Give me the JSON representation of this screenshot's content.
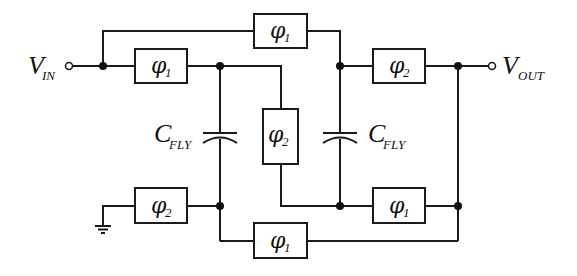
{
  "diagram": {
    "type": "switched-capacitor circuit",
    "input_label": {
      "main": "V",
      "sub": "IN"
    },
    "output_label": {
      "main": "V",
      "sub": "OUT"
    },
    "capacitor_label": {
      "main": "C",
      "sub": "FLY"
    },
    "switches": [
      {
        "id": "sw-top-bypass",
        "phase": {
          "main": "φ",
          "sub": "1"
        }
      },
      {
        "id": "sw-in",
        "phase": {
          "main": "φ",
          "sub": "1"
        }
      },
      {
        "id": "sw-right-top",
        "phase": {
          "main": "φ",
          "sub": "2"
        }
      },
      {
        "id": "sw-middle",
        "phase": {
          "main": "φ",
          "sub": "2"
        }
      },
      {
        "id": "sw-ground",
        "phase": {
          "main": "φ",
          "sub": "2"
        }
      },
      {
        "id": "sw-right-bottom",
        "phase": {
          "main": "φ",
          "sub": "1"
        }
      },
      {
        "id": "sw-bottom",
        "phase": {
          "main": "φ",
          "sub": "1"
        }
      }
    ],
    "capacitors": [
      {
        "id": "cap-left",
        "label": {
          "main": "C",
          "sub": "FLY"
        }
      },
      {
        "id": "cap-right",
        "label": {
          "main": "C",
          "sub": "FLY"
        }
      }
    ]
  }
}
